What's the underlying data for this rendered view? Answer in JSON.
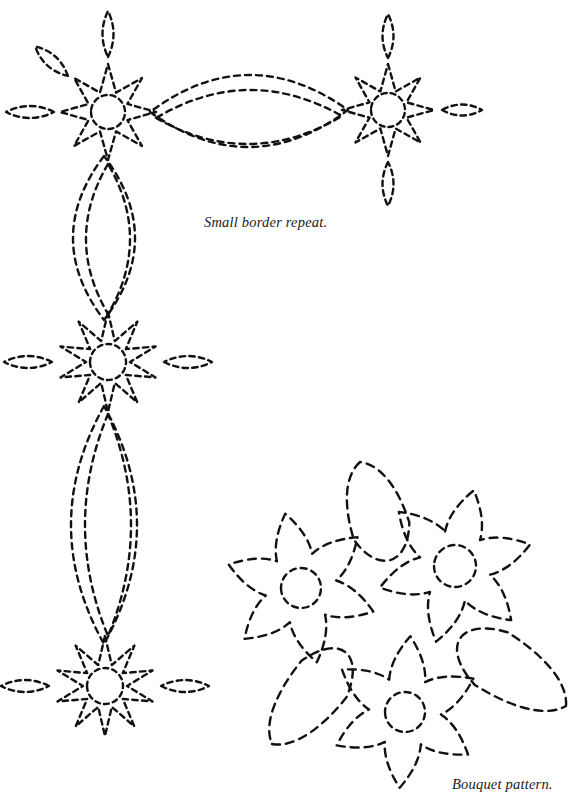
{
  "page": {
    "width": 586,
    "height": 806,
    "background_color": "#ffffff",
    "ink_color": "#111111"
  },
  "captions": [
    {
      "id": "small-border-repeat",
      "text": "Small border repeat.",
      "x": 204,
      "y": 214,
      "style": "italic-serif"
    },
    {
      "id": "bouquet-pattern",
      "text": "Bouquet pattern.",
      "x": 452,
      "y": 776,
      "style": "italic-serif"
    }
  ],
  "stroke": {
    "color": "#111111",
    "width": 2.4,
    "dash": "6,4.5",
    "linecap": "round"
  },
  "chart_data": {
    "type": "diagram",
    "elements": [
      {
        "name": "border-flower-top-left",
        "kind": "star-flower",
        "cx": 108,
        "cy": 112,
        "points": 8,
        "outer_r": 48,
        "inner_r": 21,
        "center_circle_r": 17,
        "leaves": [
          {
            "angle": -90,
            "dist": 78,
            "len": 46,
            "w": 22
          },
          {
            "angle": 180,
            "dist": 78,
            "len": 48,
            "w": 24
          },
          {
            "angle": -138,
            "dist": 76,
            "len": 44,
            "w": 24
          }
        ]
      },
      {
        "name": "border-flower-top-right",
        "kind": "star-flower",
        "cx": 388,
        "cy": 110,
        "points": 8,
        "outer_r": 46,
        "inner_r": 20,
        "center_circle_r": 17,
        "leaves": [
          {
            "angle": -90,
            "dist": 74,
            "len": 44,
            "w": 22
          },
          {
            "angle": 90,
            "dist": 74,
            "len": 44,
            "w": 22
          },
          {
            "angle": 0,
            "dist": 74,
            "len": 40,
            "w": 22
          }
        ]
      },
      {
        "name": "border-flower-middle-left",
        "kind": "star-flower",
        "cx": 108,
        "cy": 362,
        "points": 10,
        "outer_r": 50,
        "inner_r": 22,
        "center_circle_r": 18,
        "leaves": [
          {
            "angle": 180,
            "dist": 80,
            "len": 48,
            "w": 24
          },
          {
            "angle": 0,
            "dist": 80,
            "len": 48,
            "w": 24
          }
        ]
      },
      {
        "name": "border-flower-bottom-left",
        "kind": "star-flower",
        "cx": 105,
        "cy": 686,
        "points": 10,
        "outer_r": 50,
        "inner_r": 22,
        "center_circle_r": 18,
        "leaves": [
          {
            "angle": 180,
            "dist": 80,
            "len": 48,
            "w": 24
          },
          {
            "angle": 0,
            "dist": 80,
            "len": 48,
            "w": 24
          }
        ]
      },
      {
        "name": "border-lens-horizontal-outer",
        "kind": "lens",
        "x1": 150,
        "y1": 112,
        "x2": 348,
        "y2": 110,
        "bulge": 72
      },
      {
        "name": "border-lens-horizontal-inner",
        "kind": "lens",
        "x1": 156,
        "y1": 118,
        "x2": 342,
        "y2": 116,
        "bulge": 54
      },
      {
        "name": "border-lens-vertical-upper-outer",
        "kind": "lens",
        "x1": 104,
        "y1": 156,
        "x2": 104,
        "y2": 320,
        "bulge": 62
      },
      {
        "name": "border-lens-vertical-upper-inner",
        "kind": "lens",
        "x1": 108,
        "y1": 164,
        "x2": 108,
        "y2": 314,
        "bulge": 44
      },
      {
        "name": "border-lens-vertical-lower-outer",
        "kind": "lens",
        "x1": 104,
        "y1": 406,
        "x2": 104,
        "y2": 644,
        "bulge": 66
      },
      {
        "name": "border-lens-vertical-lower-inner",
        "kind": "lens",
        "x1": 108,
        "y1": 414,
        "x2": 108,
        "y2": 636,
        "bulge": 46
      },
      {
        "name": "bouquet-flower-left",
        "kind": "petal-flower",
        "cx": 301,
        "cy": 588,
        "petals": 6,
        "outer_r": 76,
        "waist_r": 36,
        "center_circle_r": 20,
        "rotation": -12
      },
      {
        "name": "bouquet-flower-right",
        "kind": "petal-flower",
        "cx": 455,
        "cy": 566,
        "petals": 6,
        "outer_r": 78,
        "waist_r": 36,
        "center_circle_r": 21,
        "rotation": 14
      },
      {
        "name": "bouquet-flower-bottom",
        "kind": "petal-flower",
        "cx": 405,
        "cy": 712,
        "petals": 6,
        "outer_r": 76,
        "waist_r": 36,
        "center_circle_r": 20,
        "rotation": 4
      },
      {
        "name": "bouquet-leaf-top",
        "kind": "teardrop",
        "tip_x": 360,
        "tip_y": 462,
        "base_x": 390,
        "base_y": 558,
        "width": 58
      },
      {
        "name": "bouquet-leaf-right",
        "kind": "teardrop",
        "tip_x": 566,
        "tip_y": 706,
        "base_x": 462,
        "base_y": 640,
        "width": 62
      },
      {
        "name": "bouquet-leaf-bottom-left",
        "kind": "teardrop",
        "tip_x": 272,
        "tip_y": 744,
        "base_x": 344,
        "base_y": 654,
        "width": 58
      }
    ]
  }
}
